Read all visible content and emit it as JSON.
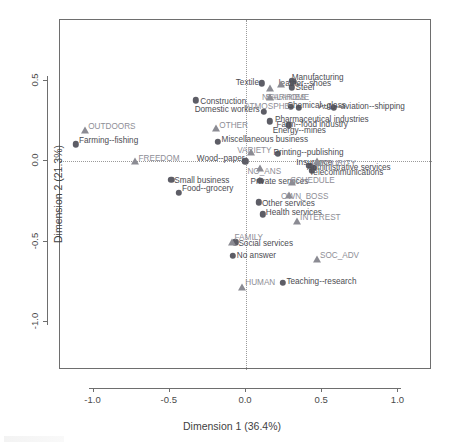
{
  "chart_data": {
    "type": "scatter",
    "title": "",
    "xlabel": "Dimension 1 (36.4%)",
    "ylabel": "Dimension 2 (21.3%)",
    "xlim": [
      -1.22,
      1.22
    ],
    "ylim": [
      -1.3,
      0.88
    ],
    "xticks": [
      "-1.0",
      "-0.5",
      "0.0",
      "0.5",
      "1.0"
    ],
    "xtick_values": [
      -1.0,
      -0.5,
      0.0,
      0.5,
      1.0
    ],
    "yticks": [
      "0.5",
      "0.0",
      "-0.5",
      "-1.0"
    ],
    "ytick_values": [
      0.5,
      0.0,
      -0.5,
      -1.0
    ],
    "grid": false,
    "legend": "none",
    "reference_lines": {
      "vertical_at_x": 0.0,
      "horizontal_at_y": 0.0,
      "style": "dotted"
    },
    "series": [
      {
        "name": "Categories (circle markers)",
        "marker": "circle",
        "color": "#5d5d66",
        "points": [
          {
            "label": "Farming--fishing",
            "x": -1.115,
            "y": 0.105,
            "lx": -1.095,
            "ly": 0.15,
            "anchor": "left"
          },
          {
            "label": "Small business",
            "x": -0.49,
            "y": -0.115,
            "lx": -0.47,
            "ly": -0.1,
            "anchor": "left"
          },
          {
            "label": "Food--grocery",
            "x": -0.44,
            "y": -0.195,
            "lx": -0.42,
            "ly": -0.15,
            "anchor": "left"
          },
          {
            "label": "Construction",
            "x": -0.33,
            "y": 0.38,
            "lx": -0.3,
            "ly": 0.395,
            "anchor": "left"
          },
          {
            "label": "Miscellaneous business",
            "x": -0.185,
            "y": 0.12,
            "lx": -0.16,
            "ly": 0.16,
            "anchor": "left"
          },
          {
            "label": "Wood--paper",
            "x": -0.005,
            "y": 0.0,
            "lx": -0.01,
            "ly": 0.04,
            "anchor": "right"
          },
          {
            "label": "No answer",
            "x": -0.085,
            "y": -0.59,
            "lx": -0.06,
            "ly": -0.565,
            "anchor": "left"
          },
          {
            "label": "Social services",
            "x": -0.07,
            "y": -0.505,
            "lx": -0.05,
            "ly": -0.49,
            "anchor": "left"
          },
          {
            "label": "Other services",
            "x": 0.085,
            "y": -0.255,
            "lx": 0.105,
            "ly": -0.24,
            "anchor": "left"
          },
          {
            "label": "Health services",
            "x": 0.11,
            "y": -0.33,
            "lx": 0.13,
            "ly": -0.3,
            "anchor": "left"
          },
          {
            "label": "Private services",
            "x": 0.095,
            "y": -0.12,
            "lx": 0.03,
            "ly": -0.105,
            "anchor": "left"
          },
          {
            "label": "Textile",
            "x": 0.105,
            "y": 0.485,
            "lx": 0.085,
            "ly": 0.51,
            "anchor": "right"
          },
          {
            "label": "Domestic workers",
            "x": 0.115,
            "y": 0.31,
            "lx": 0.09,
            "ly": 0.345,
            "anchor": "right"
          },
          {
            "label": "Energy--mines",
            "x": 0.155,
            "y": 0.25,
            "lx": 0.175,
            "ly": 0.215,
            "anchor": "left"
          },
          {
            "label": "Teaching--research",
            "x": 0.24,
            "y": -0.755,
            "lx": 0.265,
            "ly": -0.725,
            "anchor": "left"
          },
          {
            "label": "Farm--food industry",
            "x": 0.28,
            "y": 0.225,
            "lx": 0.2,
            "ly": 0.25,
            "anchor": "left"
          },
          {
            "label": "Steel",
            "x": 0.3,
            "y": 0.46,
            "lx": 0.325,
            "ly": 0.48,
            "anchor": "left"
          },
          {
            "label": "Manufacturing",
            "x": 0.31,
            "y": 0.495,
            "lx": 0.3,
            "ly": 0.545,
            "anchor": "left"
          },
          {
            "label": "leather--shoes",
            "x": 0.3,
            "y": 0.5,
            "lx": 0.215,
            "ly": 0.505,
            "anchor": "left"
          },
          {
            "label": "Pharmaceutical industries",
            "x": 0.295,
            "y": 0.34,
            "lx": 0.19,
            "ly": 0.285,
            "anchor": "left"
          },
          {
            "label": "Chemical--glass",
            "x": 0.345,
            "y": 0.335,
            "lx": 0.27,
            "ly": 0.37,
            "anchor": "left"
          },
          {
            "label": "Insurance",
            "x": 0.415,
            "y": -0.03,
            "lx": 0.33,
            "ly": 0.015,
            "anchor": "left"
          },
          {
            "label": "Telecommunications",
            "x": 0.43,
            "y": -0.06,
            "lx": 0.415,
            "ly": -0.05,
            "anchor": "left"
          },
          {
            "label": "Administrative services",
            "x": 0.445,
            "y": -0.04,
            "lx": 0.4,
            "ly": -0.015,
            "anchor": "left"
          },
          {
            "label": "Auto--aviation--shipping",
            "x": 0.575,
            "y": 0.335,
            "lx": 0.475,
            "ly": 0.365,
            "anchor": "left"
          },
          {
            "label": "Printing--publishing",
            "x": 0.21,
            "y": 0.045,
            "lx": 0.18,
            "ly": 0.075,
            "anchor": "left"
          }
        ]
      },
      {
        "name": "Supplementary variables (triangle markers)",
        "marker": "triangle",
        "color": "#8e8e96",
        "points": [
          {
            "label": "OUTDOORS",
            "x": -1.055,
            "y": 0.195,
            "lx": -1.035,
            "ly": 0.24,
            "anchor": "left"
          },
          {
            "label": "FREEDOM",
            "x": -0.73,
            "y": 0.0,
            "lx": -0.705,
            "ly": 0.04,
            "anchor": "left"
          },
          {
            "label": "OTHER",
            "x": -0.2,
            "y": 0.205,
            "lx": -0.175,
            "ly": 0.245,
            "anchor": "left"
          },
          {
            "label": "FAMILY",
            "x": -0.095,
            "y": -0.505,
            "lx": -0.075,
            "ly": -0.455,
            "anchor": "left"
          },
          {
            "label": "HUMAN",
            "x": -0.025,
            "y": -0.78,
            "lx": -0.005,
            "ly": -0.735,
            "anchor": "left"
          },
          {
            "label": "VARIETY",
            "x": 0.035,
            "y": 0.06,
            "lx": 0.055,
            "ly": 0.09,
            "anchor": "center"
          },
          {
            "label": "NO_ANS",
            "x": 0.09,
            "y": -0.04,
            "lx": 0.12,
            "ly": -0.04,
            "anchor": "center"
          },
          {
            "label": "ATMOSPHE",
            "x": 0.155,
            "y": 0.4,
            "lx": 0.14,
            "ly": 0.36,
            "anchor": "center"
          },
          {
            "label": "NEARHOME",
            "x": 0.16,
            "y": 0.455,
            "lx": 0.105,
            "ly": 0.42,
            "anchor": "left"
          },
          {
            "label": "SALARIES",
            "x": 0.23,
            "y": 0.48,
            "lx": 0.26,
            "ly": 0.42,
            "anchor": "center"
          },
          {
            "label": "SCHEDULE",
            "x": 0.3,
            "y": -0.13,
            "lx": 0.29,
            "ly": -0.095,
            "anchor": "left"
          },
          {
            "label": "OWN_BOSS",
            "x": 0.28,
            "y": -0.21,
            "lx": 0.23,
            "ly": -0.195,
            "anchor": "left"
          },
          {
            "label": "INTEREST",
            "x": 0.335,
            "y": -0.375,
            "lx": 0.355,
            "ly": -0.33,
            "anchor": "left"
          },
          {
            "label": "SOC_ADV",
            "x": 0.465,
            "y": -0.61,
            "lx": 0.485,
            "ly": -0.565,
            "anchor": "left"
          },
          {
            "label": "SECURITY",
            "x": 0.465,
            "y": 0.0,
            "lx": 0.45,
            "ly": 0.01,
            "anchor": "left"
          }
        ]
      }
    ]
  },
  "colors": {
    "frame": "#6e6e6e",
    "circle_marker": "#5d5d66",
    "triangle_marker": "#8e8e96",
    "individual_label": "#4c4c52",
    "supplementary_label": "#8e8e96",
    "reference_line": "#9a9a9a",
    "background": "#ffffff"
  }
}
